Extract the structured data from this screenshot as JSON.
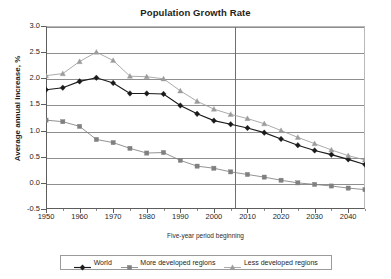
{
  "chart_data": {
    "type": "line",
    "title": "Population Growth Rate",
    "xlabel": "Five-year period beginning",
    "ylabel": "Average annual increase, %",
    "xlim": [
      1950,
      2045
    ],
    "ylim": [
      -0.5,
      3.0
    ],
    "ytick_labels": [
      "3.0",
      "2.5",
      "2.0",
      "1.5",
      "1.0",
      "0.5",
      "0.0",
      "-0.5"
    ],
    "ytick_values": [
      3.0,
      2.5,
      2.0,
      1.5,
      1.0,
      0.5,
      0.0,
      -0.5
    ],
    "xtick_labels": [
      "1950",
      "1960",
      "1970",
      "1980",
      "1990",
      "2000",
      "2010",
      "2020",
      "2030",
      "2040"
    ],
    "xtick_values": [
      1950,
      1960,
      1970,
      1980,
      1990,
      2000,
      2010,
      2020,
      2030,
      2040
    ],
    "grid": "horizontal",
    "legend_position": "bottom",
    "annotations": [
      {
        "name": "projection-divider",
        "type": "vline",
        "x": 2006,
        "label": ""
      }
    ],
    "x": [
      1950,
      1955,
      1960,
      1965,
      1970,
      1975,
      1980,
      1985,
      1990,
      1995,
      2000,
      2005,
      2010,
      2015,
      2020,
      2025,
      2030,
      2035,
      2040,
      2045
    ],
    "series": [
      {
        "name": "World",
        "marker": "diamond",
        "color": "#1a1a1a",
        "values": [
          1.78,
          1.82,
          1.94,
          2.01,
          1.91,
          1.71,
          1.71,
          1.7,
          1.48,
          1.32,
          1.19,
          1.12,
          1.05,
          0.96,
          0.84,
          0.72,
          0.62,
          0.54,
          0.45,
          0.35
        ]
      },
      {
        "name": "More developed regions",
        "marker": "square",
        "color": "#808080",
        "values": [
          1.2,
          1.17,
          1.08,
          0.83,
          0.77,
          0.66,
          0.57,
          0.58,
          0.43,
          0.32,
          0.28,
          0.21,
          0.16,
          0.11,
          0.05,
          0.0,
          -0.03,
          -0.06,
          -0.1,
          -0.13
        ]
      },
      {
        "name": "Less developed regions",
        "marker": "triangle",
        "color": "#9c9c9c",
        "values": [
          2.05,
          2.09,
          2.32,
          2.5,
          2.34,
          2.04,
          2.03,
          1.99,
          1.76,
          1.56,
          1.41,
          1.31,
          1.23,
          1.13,
          1.0,
          0.87,
          0.75,
          0.63,
          0.52,
          0.44
        ]
      }
    ]
  },
  "legend": {
    "entries": [
      {
        "label": "World"
      },
      {
        "label": "More developed regions"
      },
      {
        "label": "Less developed regions"
      }
    ]
  }
}
